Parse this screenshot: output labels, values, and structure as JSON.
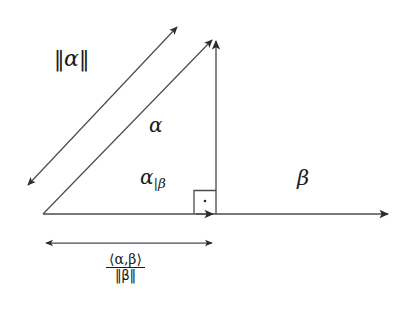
{
  "figure": {
    "background_color": "#ffffff",
    "stroke_color": "#3a3a42",
    "text_color": "#1a1a1a"
  },
  "labels": {
    "alpha_norm": {
      "open_bars": "‖",
      "symbol": "α",
      "close_bars": "‖"
    },
    "alpha": "α",
    "alpha_projection": {
      "symbol": "α",
      "subscript": "|β"
    },
    "beta": "β",
    "projection_length": {
      "numerator": "⟨α,β⟩",
      "denominator": "‖β‖"
    }
  },
  "geometry": {
    "origin_vertex": [
      43,
      214
    ],
    "apex_vertex": [
      216,
      36
    ],
    "right_vertex": [
      216,
      214
    ],
    "beta_axis": {
      "from": [
        43,
        214
      ],
      "to": [
        392,
        214
      ]
    },
    "alpha_vector": {
      "from": [
        43,
        214
      ],
      "to": [
        216,
        36
      ]
    },
    "vertical_component": {
      "from": [
        216,
        214
      ],
      "to": [
        216,
        36
      ]
    },
    "projection_vector": {
      "from": [
        43,
        214
      ],
      "to": [
        216,
        214
      ]
    },
    "alpha_norm_measure": {
      "from": [
        24,
        189
      ],
      "to": [
        181,
        23
      ]
    },
    "dimension_line": {
      "from": [
        42,
        243
      ],
      "to": [
        216,
        243
      ]
    },
    "right_angle_marker": {
      "x": 194,
      "y": 190,
      "size": 23,
      "dot": [
        205,
        201
      ]
    }
  }
}
